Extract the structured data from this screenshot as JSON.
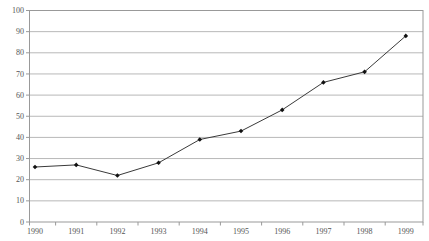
{
  "chart_data": {
    "type": "line",
    "title": "",
    "xlabel": "",
    "ylabel": "",
    "categories": [
      "1990",
      "1991",
      "1992",
      "1993",
      "1994",
      "1995",
      "1996",
      "1997",
      "1998",
      "1999"
    ],
    "series": [
      {
        "name": "series-1",
        "values": [
          26,
          27,
          22,
          28,
          39,
          43,
          53,
          66,
          71,
          88
        ]
      }
    ],
    "ylim": [
      0,
      100
    ],
    "yticks": [
      0,
      10,
      20,
      30,
      40,
      50,
      60,
      70,
      80,
      90,
      100
    ],
    "grid": true,
    "legend": "none",
    "marker": "diamond",
    "colors": {
      "line": "#3a3a3a",
      "marker": "#111111",
      "grid": "#b8b8b8",
      "frame": "#999999",
      "text": "#555555",
      "background": "#ffffff"
    }
  }
}
